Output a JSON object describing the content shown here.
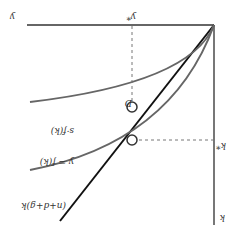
{
  "figure": {
    "orientation": "rotated-180",
    "colors": {
      "axis": "#333333",
      "investment_line": "#111111",
      "curves": "#666666",
      "dashed": "#777777",
      "point_fill": "#ffffff"
    },
    "labels": {
      "y_axis": "y",
      "y_axis_star": "y*",
      "x_axis": "k",
      "k_star": "k*",
      "output_curve": "y = f(k)",
      "savings_curve": "s·f(k)",
      "break_even_line": "(n+d+g)k",
      "point_d": "D"
    }
  }
}
